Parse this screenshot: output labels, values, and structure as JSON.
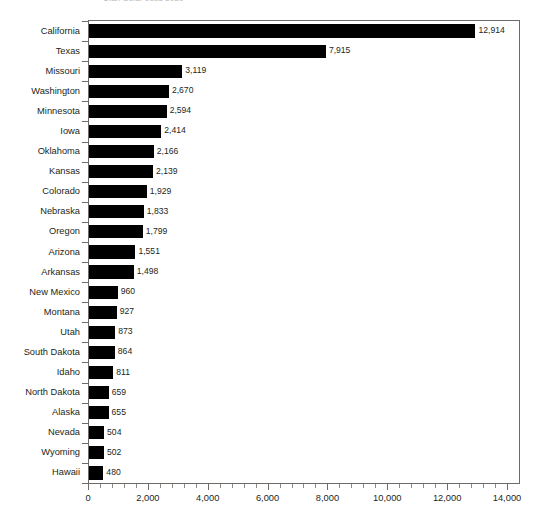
{
  "chart_data": {
    "type": "bar",
    "orientation": "horizontal",
    "title": "Utah Solar Jobs 2020",
    "xlabel": "",
    "ylabel": "",
    "xlim": [
      0,
      14000
    ],
    "xticks": [
      0,
      2000,
      4000,
      6000,
      8000,
      10000,
      12000,
      14000
    ],
    "xtick_labels": [
      "0",
      "2,000",
      "4,000",
      "6,000",
      "8,000",
      "10,000",
      "12,000",
      "14,000"
    ],
    "x_minor_tick_step": 400,
    "grid": false,
    "legend": null,
    "bar_color": "#000000",
    "frame_color": "#6d6a68",
    "text_color": "#231f20",
    "categories": [
      "California",
      "Texas",
      "Missouri",
      "Washington",
      "Minnesota",
      "Iowa",
      "Oklahoma",
      "Kansas",
      "Colorado",
      "Nebraska",
      "Oregon",
      "Arizona",
      "Arkansas",
      "New Mexico",
      "Montana",
      "Utah",
      "South Dakota",
      "Idaho",
      "North Dakota",
      "Alaska",
      "Nevada",
      "Wyoming",
      "Hawaii"
    ],
    "values": [
      12914,
      7915,
      3119,
      2670,
      2594,
      2414,
      2166,
      2139,
      1929,
      1833,
      1799,
      1551,
      1498,
      960,
      927,
      873,
      864,
      811,
      659,
      655,
      504,
      502,
      480
    ],
    "value_labels": [
      "12,914",
      "7,915",
      "3,119",
      "2,670",
      "2,594",
      "2,414",
      "2,166",
      "2,139",
      "1,929",
      "1,833",
      "1,799",
      "1,551",
      "1,498",
      "960",
      "927",
      "873",
      "864",
      "811",
      "659",
      "655",
      "504",
      "502",
      "480"
    ]
  }
}
